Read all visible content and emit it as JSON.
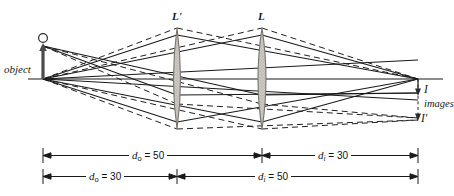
{
  "figure": {
    "type": "optics-ray-diagram",
    "title": "",
    "background_color": "#ffffff",
    "line_color": "#1a1a1a",
    "lens_fill_color": "#c9c6c1",
    "lens_edge_color": "#6e6b66"
  },
  "labels": {
    "object": "object",
    "lens_primed": "L'",
    "lens": "L",
    "image": "I",
    "images": "images",
    "image_primed": "I'"
  },
  "dimensions": [
    {
      "id": "do-50",
      "text_prefix": "d",
      "subscript": "o",
      "text_suffix": "= 50",
      "full": "do = 50",
      "value": 50,
      "symbol": "d_o",
      "from_x": 43,
      "to_x": 262,
      "row": 1
    },
    {
      "id": "di-30",
      "text_prefix": "d",
      "subscript": "i",
      "text_suffix": "= 30",
      "full": "di = 30",
      "value": 30,
      "symbol": "d_i",
      "from_x": 262,
      "to_x": 418,
      "row": 1
    },
    {
      "id": "do-30",
      "text_prefix": "d",
      "subscript": "o",
      "text_suffix": "= 30",
      "full": "do = 30",
      "value": 30,
      "symbol": "d_o",
      "from_x": 43,
      "to_x": 177,
      "row": 2
    },
    {
      "id": "di-50",
      "text_prefix": "d",
      "subscript": "i",
      "text_suffix": "= 50",
      "full": "di = 50",
      "value": 50,
      "symbol": "d_i",
      "from_x": 177,
      "to_x": 418,
      "row": 2
    }
  ],
  "geometry": {
    "axis_y": 79,
    "axis_x_start": 28,
    "axis_x_end": 443,
    "object_x": 43,
    "object_top_y": 46,
    "object_head_y": 41,
    "lens_primed_x": 177,
    "lens_x": 262,
    "lens_top_y": 28,
    "lens_bottom_y": 129,
    "image_x": 418,
    "image_bottom_y": 95,
    "image_primed_bottom_y": 120,
    "dim_row1_y": 155,
    "dim_row2_y": 176
  }
}
